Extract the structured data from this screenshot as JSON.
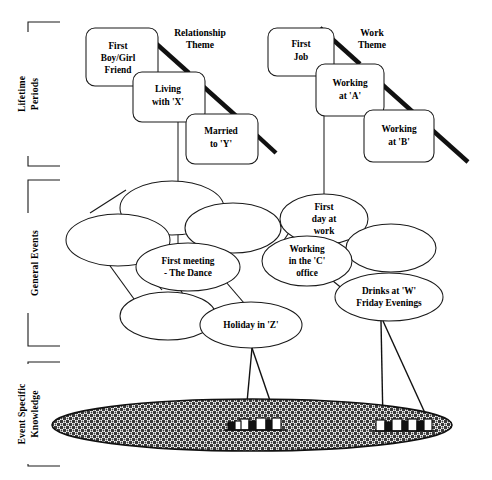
{
  "figure": {
    "background_color": "#ffffff",
    "ink_color": "#1a1a1a"
  },
  "axis_labels": [
    {
      "id": "lifetime-periods",
      "text": "Lifetime\nPeriods",
      "line1": "Lifetime",
      "line2": "Periods"
    },
    {
      "id": "general-events",
      "text": "General Events",
      "line1": "General Events",
      "line2": ""
    },
    {
      "id": "event-specific-knowledge",
      "text": "Event Specific\nKnowledge",
      "line1": "Event Specific",
      "line2": "Knowledge"
    }
  ],
  "themes": [
    {
      "id": "relationship-theme",
      "line1": "Relationship",
      "line2": "Theme"
    },
    {
      "id": "work-theme",
      "line1": "Work",
      "line2": "Theme"
    }
  ],
  "lifetime_period_boxes": [
    {
      "id": "first-boy-girl-friend",
      "lines": [
        "First",
        "Boy/Girl",
        "Friend"
      ]
    },
    {
      "id": "living-with-x",
      "lines": [
        "Living",
        "with  'X'"
      ]
    },
    {
      "id": "married-to-y",
      "lines": [
        "Married",
        "to  'Y'"
      ]
    },
    {
      "id": "first-job",
      "lines": [
        "First",
        "Job"
      ]
    },
    {
      "id": "working-at-a",
      "lines": [
        "Working",
        "at  'A'"
      ]
    },
    {
      "id": "working-at-b",
      "lines": [
        "Working",
        "at  'B'"
      ]
    }
  ],
  "general_event_ellipses": [
    {
      "id": "general-event-blank-1",
      "lines": []
    },
    {
      "id": "general-event-blank-2",
      "lines": []
    },
    {
      "id": "general-event-blank-3",
      "lines": []
    },
    {
      "id": "general-event-blank-4",
      "lines": []
    },
    {
      "id": "first-meeting-the-dance",
      "lines": [
        "First  meeting",
        "- The  Dance"
      ]
    },
    {
      "id": "holiday-in-z",
      "lines": [
        "Holiday  in  'Z'"
      ]
    },
    {
      "id": "first-day-at-work",
      "lines": [
        "First",
        "day at",
        "work"
      ]
    },
    {
      "id": "general-event-blank-5",
      "lines": []
    },
    {
      "id": "working-in-the-c-office",
      "lines": [
        "Working",
        "in the 'C'",
        "office"
      ]
    },
    {
      "id": "drinks-at-w-friday-evenings",
      "lines": [
        "Drinks at 'W'",
        "Friday  Evenings"
      ]
    }
  ],
  "event_specific_knowledge": {
    "id": "esk-band",
    "description": "stippled elongated ellipse",
    "clusters": [
      {
        "id": "esk-cluster-left"
      },
      {
        "id": "esk-cluster-right"
      }
    ]
  }
}
